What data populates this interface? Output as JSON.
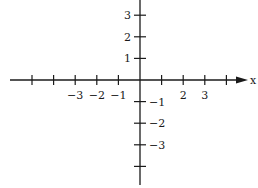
{
  "diagram": {
    "type": "cartesian-axes",
    "origin_px": [
      140,
      80
    ],
    "unit_px": 21.6,
    "axis_color": "#1a1a1a",
    "x_axis": {
      "label": "x",
      "has_arrow": true,
      "tick_values": [
        -5,
        -4,
        -3,
        -2,
        -1,
        1,
        2,
        3,
        4
      ],
      "labeled_ticks": [
        {
          "value": -3,
          "text": "-3"
        },
        {
          "value": -2,
          "text": "-2"
        },
        {
          "value": -1,
          "text": "-1"
        },
        {
          "value": 2,
          "text": "2"
        },
        {
          "value": 3,
          "text": "3"
        }
      ]
    },
    "y_axis": {
      "label": "",
      "has_arrow": false,
      "tick_values": [
        3,
        2,
        1,
        -1,
        -2,
        -3,
        -4
      ],
      "labeled_ticks": [
        {
          "value": 3,
          "text": "3"
        },
        {
          "value": 2,
          "text": "2"
        },
        {
          "value": 1,
          "text": "1"
        },
        {
          "value": -1,
          "text": "-1"
        },
        {
          "value": -2,
          "text": "-2"
        },
        {
          "value": -3,
          "text": "-3"
        }
      ]
    }
  }
}
